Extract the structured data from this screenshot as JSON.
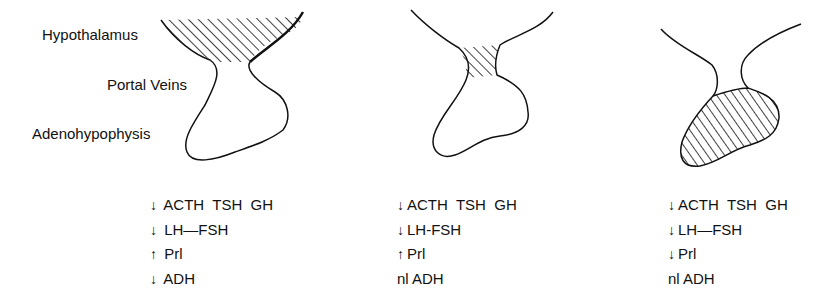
{
  "labels": {
    "hypothalamus": "Hypothalamus",
    "portal_veins": "Portal Veins",
    "adenohypophysis": "Adenohypophysis"
  },
  "panels": [
    {
      "lesion_site": "hypothalamus",
      "rows": [
        {
          "arrow": "↓",
          "text": "ACTH  TSH  GH"
        },
        {
          "arrow": "↓",
          "text": "LH—FSH"
        },
        {
          "arrow": "↑",
          "text": "Prl"
        },
        {
          "arrow": "↓",
          "text": "ADH"
        }
      ]
    },
    {
      "lesion_site": "portal veins / stalk",
      "rows": [
        {
          "arrow": "↓",
          "text": "ACTH  TSH  GH"
        },
        {
          "arrow": "↓",
          "text": "LH-FSH"
        },
        {
          "arrow": "↑",
          "text": "Prl"
        },
        {
          "arrow": "nl",
          "text": "ADH"
        }
      ]
    },
    {
      "lesion_site": "adenohypophysis",
      "rows": [
        {
          "arrow": "↓",
          "text": "ACTH  TSH  GH"
        },
        {
          "arrow": "↓",
          "text": "LH—FSH"
        },
        {
          "arrow": "↓",
          "text": "Prl"
        },
        {
          "arrow": "nl",
          "text": "ADH"
        }
      ]
    }
  ],
  "colors": {
    "ink": "#111111",
    "background": "#ffffff"
  }
}
